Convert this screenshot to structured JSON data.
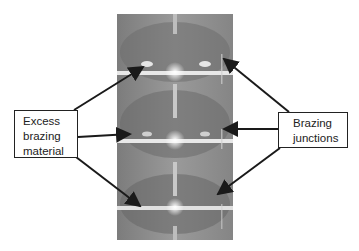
{
  "diagram": {
    "photo_description": "Grayscale photograph of stacked brazed assembly with three horizontal junction bands",
    "left_label": {
      "lines": [
        "Excess",
        "brazing",
        "material"
      ]
    },
    "right_label": {
      "lines": [
        "Brazing",
        "junctions"
      ]
    },
    "arrow_color": "#1a1a1a"
  }
}
